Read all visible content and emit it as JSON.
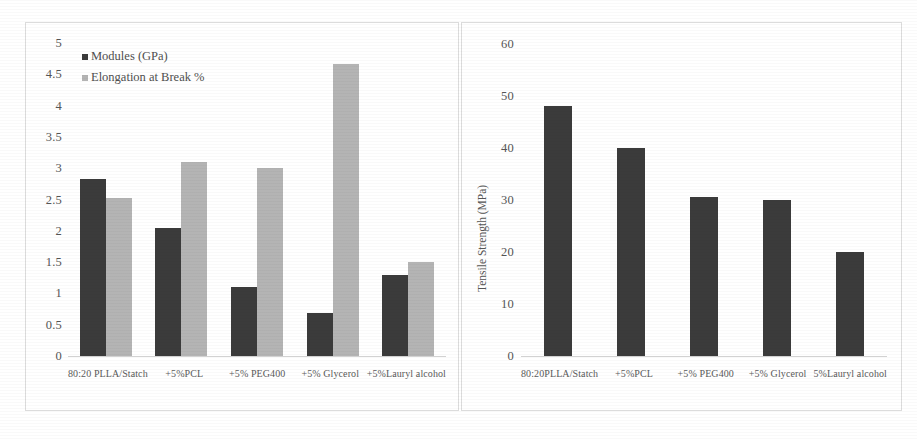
{
  "figure": {
    "panels": [
      "modulus-elongation-panel",
      "tensile-strength-panel"
    ]
  },
  "chart_data": [
    {
      "type": "bar",
      "title": "",
      "xlabel": "",
      "ylabel": "",
      "ylim": [
        0,
        5
      ],
      "ytick_labels": [
        "5",
        "4.5",
        "4",
        "3.5",
        "3",
        "2.5",
        "2",
        "1.5",
        "1",
        "0.5",
        "0"
      ],
      "ytick_values": [
        5,
        4.5,
        4,
        3.5,
        3,
        2.5,
        2,
        1.5,
        1,
        0.5,
        0
      ],
      "grid": false,
      "legend_position": "top-left",
      "categories": [
        "80:20 PLLA/Statch",
        "+5%PCL",
        "+5% PEG400",
        "+5% Glycerol",
        "+5%Lauryl alcohol"
      ],
      "series": [
        {
          "name": "Modules (GPa)",
          "color": "#3b3b3b",
          "values": [
            2.83,
            2.05,
            1.1,
            0.68,
            1.3
          ]
        },
        {
          "name": "Elongation at Break %",
          "color": "#b4b4b4",
          "values": [
            2.52,
            3.1,
            3.0,
            4.67,
            1.5
          ]
        }
      ]
    },
    {
      "type": "bar",
      "title": "",
      "xlabel": "",
      "ylabel": "Tensile Strength (MPa)",
      "ylim": [
        0,
        60
      ],
      "ytick_labels": [
        "60",
        "50",
        "40",
        "30",
        "20",
        "10",
        "0"
      ],
      "ytick_values": [
        60,
        50,
        40,
        30,
        20,
        10,
        0
      ],
      "grid": false,
      "legend_position": "none",
      "categories": [
        "80:20PLLA/Statch",
        "+5%PCL",
        "+5% PEG400",
        "+5% Glycerol",
        "5%Lauryl alcohol"
      ],
      "series": [
        {
          "name": "Tensile Strength (MPa)",
          "color": "#3b3b3b",
          "values": [
            48,
            40,
            30.5,
            30,
            20
          ]
        }
      ]
    }
  ]
}
